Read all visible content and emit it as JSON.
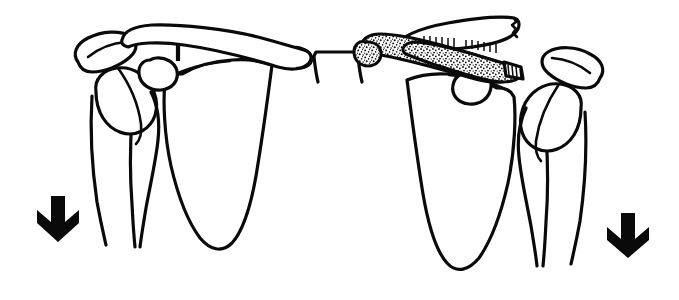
{
  "figure": {
    "background_color": "#ffffff",
    "line_color": "#0a0a0a",
    "width": 679,
    "height": 300
  },
  "panels": [
    {
      "id": "left-shoulder",
      "side_label": "left",
      "condition": "intact",
      "structures": [
        "clavicle",
        "acromion",
        "coracoid-process",
        "scapula",
        "humerus",
        "glenohumeral-joint",
        "coracoclavicular-ligament"
      ]
    },
    {
      "id": "right-shoulder",
      "side_label": "right",
      "condition": "fractured-displaced",
      "structures": [
        "clavicle-fractured",
        "clavicle-stippled-fragment",
        "acromion",
        "coracoid-process",
        "scapula",
        "humerus",
        "glenohumeral-joint",
        "coracoclavicular-ligament"
      ]
    }
  ],
  "center": {
    "id": "sternum-manubrium",
    "label": "manubrium"
  },
  "arrows": [
    {
      "id": "arrow-left",
      "direction": "down",
      "color": "#0a0a0a",
      "x": 58,
      "y": 219
    },
    {
      "id": "arrow-right",
      "direction": "down",
      "color": "#0a0a0a",
      "x": 628,
      "y": 236
    }
  ],
  "annotations": {
    "text_labels": [],
    "has_text": false
  }
}
